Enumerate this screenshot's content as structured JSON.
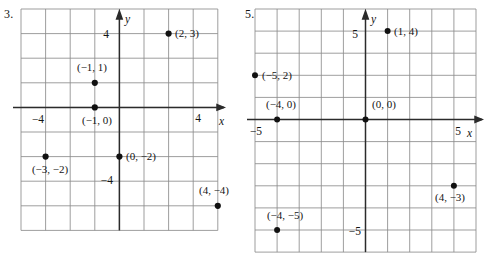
{
  "page": {
    "background_color": "#ffffff",
    "grid_line_color": "#8c8c8c",
    "axis_color": "#2b2b2b",
    "point_color": "#111111",
    "text_color": "#141414"
  },
  "problems": [
    {
      "number_label": "3.",
      "grid": {
        "cols": 8,
        "rows": 9,
        "cell_px": 24.6,
        "units_per_cell": 1,
        "origin_col": 4,
        "origin_row": 4
      },
      "axes": {
        "x_axis_name": "x",
        "y_axis_name": "y",
        "x_tick_labels": [
          {
            "text": "−4",
            "value": -4
          },
          {
            "text": "4",
            "value": 4
          }
        ],
        "y_tick_labels": [
          {
            "text": "4",
            "value": 4
          },
          {
            "text": "−4",
            "value": -4
          }
        ]
      },
      "points": [
        {
          "label": "(2, 3)",
          "x": 2,
          "y": 3,
          "label_side": "right"
        },
        {
          "label": "(−1, 1)",
          "x": -1,
          "y": 1,
          "label_side": "above-left"
        },
        {
          "label": "(−1, 0)",
          "x": -1,
          "y": 0,
          "label_side": "below-left"
        },
        {
          "label": "(−3, −2)",
          "x": -3,
          "y": -2,
          "label_side": "below-left"
        },
        {
          "label": "(0, −2)",
          "x": 0,
          "y": -2,
          "label_side": "right"
        },
        {
          "label": "(4, −4)",
          "x": 4,
          "y": -4,
          "label_side": "above-left"
        }
      ]
    },
    {
      "number_label": "5.",
      "grid": {
        "cols": 10,
        "rows": 11,
        "cell_px": 22.1,
        "units_per_cell": 1,
        "origin_col": 5,
        "origin_row": 5
      },
      "axes": {
        "x_axis_name": "x",
        "y_axis_name": "y",
        "x_tick_labels": [
          {
            "text": "−5",
            "value": -5
          },
          {
            "text": "5",
            "value": 5
          }
        ],
        "y_tick_labels": [
          {
            "text": "5",
            "value": 5
          },
          {
            "text": "−5",
            "value": -5
          }
        ]
      },
      "points": [
        {
          "label": "(1, 4)",
          "x": 1,
          "y": 4,
          "label_side": "right"
        },
        {
          "label": "(−5, 2)",
          "x": -5,
          "y": 2,
          "label_side": "right"
        },
        {
          "label": "(−4, 0)",
          "x": -4,
          "y": 0,
          "label_side": "above-left"
        },
        {
          "label": "(0, 0)",
          "x": 0,
          "y": 0,
          "label_side": "above-right"
        },
        {
          "label": "(4, −3)",
          "x": 4,
          "y": -3,
          "label_side": "below-left"
        },
        {
          "label": "(−4, −5)",
          "x": -4,
          "y": -5,
          "label_side": "above-left"
        }
      ]
    }
  ]
}
